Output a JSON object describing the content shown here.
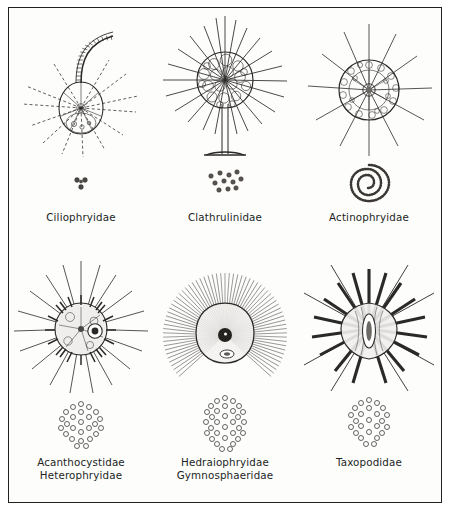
{
  "figure": {
    "kind": "scientific-illustration-plate",
    "border_color": "#23211f",
    "ink_color": "#211f1d",
    "background_color": "#fdfdfc",
    "columns": 3,
    "rows": 2
  },
  "panels": [
    {
      "id": "ciliophryidae",
      "label": "Ciliophryidae",
      "row": 1,
      "column": 1,
      "organism_form": "ovoid-cell-with-curved-flagellum-and-radiating-axopodia",
      "inset_name": "scale-cluster-small-triad",
      "inset_form": "tiny-granule-triad"
    },
    {
      "id": "clathrulinidae",
      "label": "Clathrulinidae",
      "row": 1,
      "column": 2,
      "organism_form": "stalked-spherical-lattice-capsule-with-long-axopodia",
      "inset_name": "scale-cluster-scattered-granules",
      "inset_form": "scattered-round-scales"
    },
    {
      "id": "actinophryidae",
      "label": "Actinophryidae",
      "row": 1,
      "column": 3,
      "organism_form": "spherical-vacuolated-cell-with-radiating-axopodia",
      "inset_name": "spiral-scale-coil",
      "inset_form": "beaded-spiral"
    },
    {
      "id": "acanthocystidae-heterophryidae",
      "label": "Acanthocystidae\nHeterophryidae",
      "row": 2,
      "column": 1,
      "organism_form": "spherical-cell-with-spine-scales-and-long-axopodia",
      "inset_name": "scale-plate-hexagonal-lattice-round",
      "inset_form": "honeycomb-plate-round"
    },
    {
      "id": "hedraiophryidae-gymnosphaeridae",
      "label": "Hedraiophryidae\nGymnosphaeridae",
      "row": 2,
      "column": 2,
      "organism_form": "rounded-cell-with-dense-fine-radiating-axopodia-and-dark-centrosome",
      "inset_name": "scale-plate-hexagonal-lattice-tall",
      "inset_form": "honeycomb-plate-tall"
    },
    {
      "id": "taxopodidae",
      "label": "Taxopodidae",
      "row": 2,
      "column": 3,
      "organism_form": "ovoid-cell-with-thick-paddle-like-spines",
      "inset_name": "scale-plate-hexagonal-lattice-oval",
      "inset_form": "honeycomb-plate-oval"
    }
  ]
}
